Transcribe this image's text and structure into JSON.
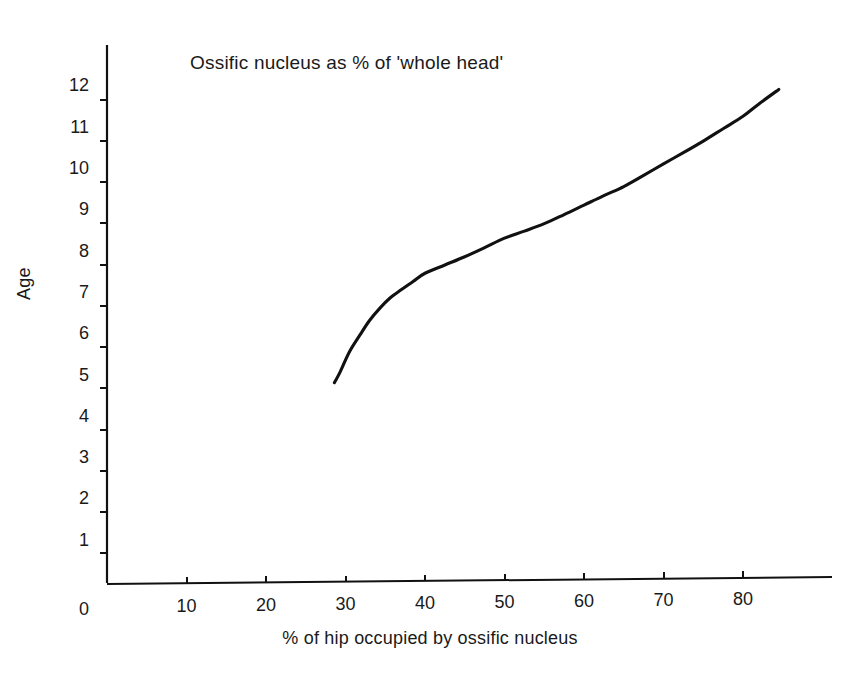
{
  "chart_data": {
    "type": "line",
    "title": "Ossific nucleus as % of 'whole head'",
    "xlabel": "% of hip occupied by ossific nucleus",
    "ylabel": "Age",
    "xlim": [
      0,
      88
    ],
    "ylim": [
      0,
      12.6
    ],
    "grid": false,
    "legend": null,
    "xticks": [
      0,
      10,
      20,
      30,
      40,
      50,
      60,
      70,
      80
    ],
    "xtick_labels": [
      "0",
      "10",
      "20",
      "30",
      "40",
      "50",
      "60",
      "70",
      "80"
    ],
    "yticks": [
      0,
      1,
      2,
      3,
      4,
      5,
      6,
      7,
      8,
      9,
      10,
      11,
      12
    ],
    "ytick_labels": [
      "0",
      "1",
      "2",
      "3",
      "4",
      "5",
      "6",
      "7",
      "8",
      "9",
      "10",
      "11",
      "12"
    ],
    "series": [
      {
        "name": "Age vs % of hip occupied by ossific nucleus",
        "color": "#111111",
        "x": [
          28.6,
          29.3,
          30.5,
          31.8,
          33.0,
          34.3,
          35.6,
          37.0,
          38.5,
          40.0,
          42.5,
          45.0,
          47.5,
          50.0,
          52.5,
          55.0,
          57.5,
          60.0,
          62.5,
          65.0,
          67.5,
          70.0,
          72.5,
          75.0,
          77.5,
          80.0,
          82.0,
          84.5
        ],
        "y": [
          4.85,
          5.1,
          5.6,
          6.0,
          6.35,
          6.65,
          6.9,
          7.1,
          7.3,
          7.5,
          7.7,
          7.9,
          8.12,
          8.35,
          8.52,
          8.7,
          8.92,
          9.15,
          9.38,
          9.6,
          9.87,
          10.15,
          10.42,
          10.7,
          11.0,
          11.3,
          11.6,
          11.95
        ]
      }
    ]
  },
  "axes": {
    "title": "Ossific nucleus as % of 'whole head'",
    "x_label": "% of hip occupied by ossific nucleus",
    "y_label": "Age"
  }
}
